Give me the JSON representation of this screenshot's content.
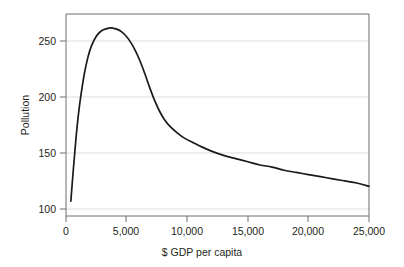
{
  "chart_data": {
    "type": "line",
    "title": "",
    "xlabel": "$ GDP per capita",
    "ylabel": "Pollution",
    "xlim": [
      0,
      25000
    ],
    "ylim": [
      85,
      275
    ],
    "grid": "horizontal",
    "legend": "none",
    "xticks": [
      0,
      5000,
      10000,
      15000,
      20000,
      25000
    ],
    "xtick_labels": [
      "0",
      "5,000",
      "10,000",
      "15,000",
      "20,000",
      "25,000"
    ],
    "yticks": [
      100,
      150,
      200,
      250
    ],
    "ytick_labels": [
      "100",
      "150",
      "200",
      "250"
    ],
    "series": [
      {
        "name": "Pollution",
        "color": "#1a1a1a",
        "x": [
          400,
          600,
          800,
          1000,
          1200,
          1500,
          1800,
          2100,
          2500,
          2900,
          3300,
          3700,
          4100,
          4500,
          4900,
          5300,
          5700,
          6100,
          6500,
          6900,
          7300,
          7700,
          8100,
          8600,
          9200,
          9800,
          10500,
          11200,
          12000,
          13000,
          14000,
          15000,
          16000,
          17000,
          18000,
          19000,
          20000,
          21000,
          22000,
          23000,
          24000,
          25000
        ],
        "y": [
          99,
          128,
          155,
          178,
          196,
          218,
          234,
          245,
          254,
          259,
          261,
          262,
          261,
          259,
          255,
          249,
          241,
          231,
          219,
          206,
          194,
          184,
          176,
          169,
          163,
          158,
          154,
          150,
          146,
          142,
          139,
          136,
          133,
          131,
          128,
          126,
          124,
          122,
          120,
          118,
          116,
          113
        ]
      }
    ],
    "annotations": []
  },
  "axes": {
    "y_title": "Pollution",
    "x_title": "$ GDP per capita"
  },
  "colors": {
    "curve": "#1a1a1a",
    "grid": "#d9d9d9",
    "frame": "#6d6e71",
    "background": "#ffffff",
    "text": "#231f20"
  }
}
